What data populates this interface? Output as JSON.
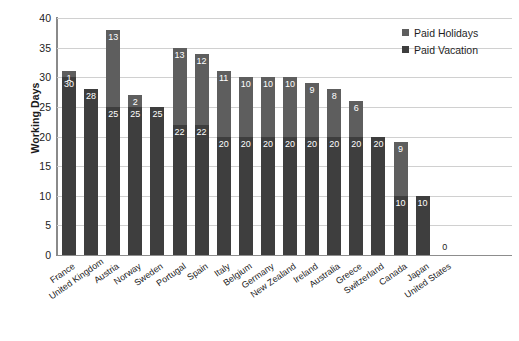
{
  "chart_data": {
    "type": "bar",
    "subtype": "stacked",
    "title": "",
    "xlabel": "",
    "ylabel": "Working Days",
    "ylim": [
      0,
      40
    ],
    "ytick_step": 5,
    "yticks": [
      0,
      5,
      10,
      15,
      20,
      25,
      30,
      35,
      40
    ],
    "grid": true,
    "legend_position": "top-right",
    "categories": [
      "France",
      "United Kingdom",
      "Austria",
      "Norway",
      "Sweden",
      "Portugal",
      "Spain",
      "Italy",
      "Belgium",
      "Germany",
      "New Zealand",
      "Ireland",
      "Australia",
      "Greece",
      "Switzerland",
      "Canada",
      "Japan",
      "United States"
    ],
    "series": [
      {
        "name": "Paid Vacation",
        "color": "#3e3e3e",
        "values": [
          30,
          28,
          25,
          25,
          25,
          22,
          22,
          20,
          20,
          20,
          20,
          20,
          20,
          20,
          20,
          10,
          10,
          0
        ]
      },
      {
        "name": "Paid Holidays",
        "color": "#5e5e5e",
        "values": [
          1,
          0,
          13,
          2,
          0,
          13,
          12,
          11,
          10,
          10,
          10,
          9,
          8,
          6,
          0,
          9,
          0,
          0
        ]
      }
    ],
    "totals": [
      31,
      28,
      38,
      27,
      25,
      35,
      34,
      31,
      30,
      30,
      30,
      29,
      28,
      26,
      20,
      19,
      10,
      0
    ],
    "zero_value_label": "0",
    "zero_value_category": "United States"
  },
  "legend": {
    "items": [
      {
        "label": "Paid Holidays",
        "color": "#5e5e5e"
      },
      {
        "label": "Paid Vacation",
        "color": "#3e3e3e"
      }
    ]
  },
  "axis": {
    "y_title": "Working Days"
  }
}
